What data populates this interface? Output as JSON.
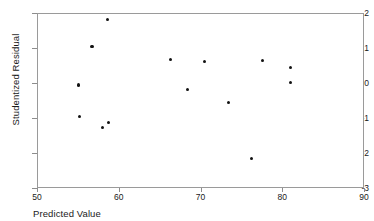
{
  "chart_data": {
    "type": "scatter",
    "title": "",
    "xlabel": "Predicted Value",
    "ylabel": "Studentized Residual",
    "xlim": [
      50,
      90
    ],
    "ylim": [
      -3,
      2
    ],
    "xticks": [
      50,
      60,
      70,
      80,
      90
    ],
    "yticks": [
      2,
      1,
      0,
      -1,
      -2,
      -3
    ],
    "xtick_labels": [
      "50",
      "60",
      "70",
      "80",
      "90"
    ],
    "ytick_labels": [
      "2",
      "1",
      "0",
      "-1",
      "-2",
      "-3"
    ],
    "grid": false,
    "legend": false,
    "marker_color": "#121212",
    "frame_color": "#9a9a9a",
    "points": [
      {
        "x": 55.0,
        "y": -0.03
      },
      {
        "x": 55.1,
        "y": -0.92
      },
      {
        "x": 56.6,
        "y": 1.07
      },
      {
        "x": 57.9,
        "y": -1.25
      },
      {
        "x": 58.5,
        "y": 1.85
      },
      {
        "x": 58.6,
        "y": -1.1
      },
      {
        "x": 66.2,
        "y": 0.71
      },
      {
        "x": 68.3,
        "y": -0.15
      },
      {
        "x": 70.4,
        "y": 0.64
      },
      {
        "x": 73.3,
        "y": -0.52
      },
      {
        "x": 76.1,
        "y": -2.13
      },
      {
        "x": 77.5,
        "y": 0.67
      },
      {
        "x": 80.9,
        "y": 0.48
      },
      {
        "x": 80.9,
        "y": 0.04
      }
    ]
  }
}
